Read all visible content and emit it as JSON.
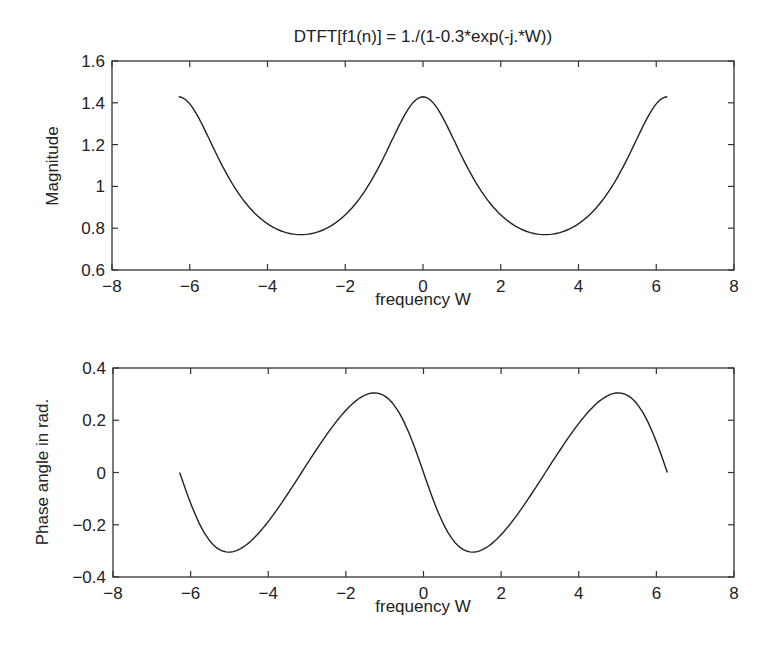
{
  "figure": {
    "title": "DTFT[f1(n)] = 1./(1-0.3*exp(-j.*W))"
  },
  "chart_data": [
    {
      "type": "line",
      "title": "DTFT[f1(n)] = 1./(1-0.3*exp(-j.*W))",
      "xlabel": "frequency W",
      "ylabel": "Magnitude",
      "xlim": [
        -8,
        8
      ],
      "ylim": [
        0.6,
        1.6
      ],
      "xticks": [
        "-8",
        "-6",
        "-4",
        "-2",
        "0",
        "2",
        "4",
        "6",
        "8"
      ],
      "yticks": [
        "0.6",
        "0.8",
        "1",
        "1.2",
        "1.4",
        "1.6"
      ],
      "grid": false,
      "series": [
        {
          "name": "Magnitude",
          "x": [
            -6.283,
            -5.498,
            -4.712,
            -3.927,
            -3.142,
            -2.356,
            -1.571,
            -0.785,
            0,
            0.785,
            1.571,
            2.356,
            3.142,
            3.927,
            4.712,
            5.498,
            6.283
          ],
          "values": [
            1.429,
            1.243,
            0.958,
            0.814,
            0.769,
            0.814,
            0.958,
            1.243,
            1.429,
            1.243,
            0.958,
            0.814,
            0.769,
            0.814,
            0.958,
            1.243,
            1.429
          ]
        }
      ]
    },
    {
      "type": "line",
      "title": "",
      "xlabel": "frequency W",
      "ylabel": "Phase angle in rad.",
      "xlim": [
        -8,
        8
      ],
      "ylim": [
        -0.4,
        0.4
      ],
      "xticks": [
        "-8",
        "-6",
        "-4",
        "-2",
        "0",
        "2",
        "4",
        "6",
        "8"
      ],
      "yticks": [
        "-0.4",
        "-0.2",
        "0",
        "0.2",
        "0.4"
      ],
      "grid": false,
      "series": [
        {
          "name": "Phase",
          "x": [
            -6.283,
            -5.498,
            -5.013,
            -4.712,
            -3.927,
            -3.142,
            -2.356,
            -1.571,
            -1.271,
            -0.785,
            0,
            0.785,
            1.271,
            1.571,
            2.356,
            3.142,
            3.927,
            4.712,
            5.013,
            5.498,
            6.283
          ],
          "values": [
            0,
            -0.277,
            -0.305,
            -0.291,
            -0.189,
            0,
            0.189,
            0.291,
            0.305,
            0.277,
            0,
            -0.277,
            -0.305,
            -0.291,
            -0.189,
            0,
            0.189,
            0.291,
            0.305,
            0.277,
            0
          ]
        }
      ]
    }
  ],
  "axes": {
    "top": {
      "ylabel": "Magnitude",
      "xlabel": "frequency W"
    },
    "bottom": {
      "ylabel": "Phase angle in rad.",
      "xlabel": "frequency W"
    }
  }
}
